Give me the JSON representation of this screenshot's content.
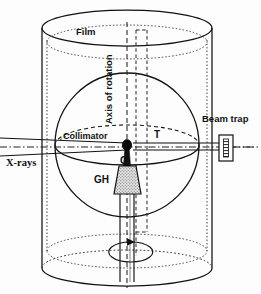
{
  "figure": {
    "name": "x-ray-diffraction-camera-diagram",
    "stroke_color": "#111111",
    "background_color": "#fdfdfd",
    "fill_crystal_color": "#111111",
    "fill_goniometer_color": "#d9d9d9"
  },
  "labels": {
    "film": "Film",
    "axis_of_rotation": "Axis of rotation",
    "collimator": "Collimator",
    "turntable": "T",
    "crystal": "C",
    "goniometer_head": "GH",
    "beam_trap": "Beam trap",
    "xrays": "X-rays"
  },
  "geometry": {
    "cylinder": {
      "left_x": 42,
      "right_x": 212,
      "top_y": 28,
      "bottom_y": 268,
      "ellipse_ry": 18,
      "film_inset": 5
    },
    "sphere": {
      "center_x": 127,
      "center_y": 145,
      "radius": 72,
      "equator_ry": 20
    },
    "crystal_point": {
      "x": 127,
      "y": 145,
      "r": 4
    },
    "beam_axis_y": 147,
    "rotation_axis_x": 127,
    "turntable_dashed_x": [
      136,
      147
    ],
    "beam_trap_box": {
      "x": 219,
      "y": 135,
      "w": 14,
      "h": 26
    },
    "rotation_arrow_ellipse": {
      "cx": 131,
      "cy": 252,
      "rx": 22,
      "ry": 10
    }
  }
}
